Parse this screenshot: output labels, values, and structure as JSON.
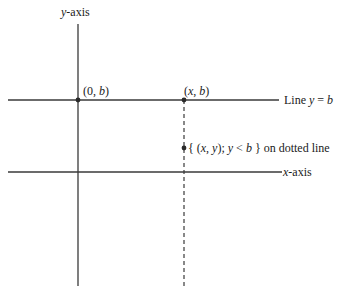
{
  "diagram": {
    "colors": {
      "line": "#3a3a3a",
      "point": "#2a2a2a",
      "text": "#1a1a1a",
      "background": "#ffffff"
    },
    "y_axis": {
      "label_var": "y",
      "label_suffix": "-axis"
    },
    "x_axis": {
      "label_var": "x",
      "label_suffix": "-axis"
    },
    "line_yb": {
      "label_prefix": "Line ",
      "label_var": "y",
      "label_eq": " = ",
      "label_val": "b"
    },
    "points": [
      {
        "id": "0b",
        "open": "(",
        "a": "0",
        "sep": ", ",
        "b": "b",
        "close": ")"
      },
      {
        "id": "xb",
        "open": "(",
        "a": "x",
        "sep": ", ",
        "b": "b",
        "close": ")"
      }
    ],
    "set_label": {
      "open_brace": "{ ",
      "tuple_open": "(",
      "x": "x",
      "comma": ", ",
      "y": "y",
      "tuple_close": ")",
      "semicolon": "; ",
      "cond_var": "y",
      "cond_op": " < ",
      "cond_val": "b",
      "close_brace": " }",
      "suffix": " on dotted line"
    }
  }
}
